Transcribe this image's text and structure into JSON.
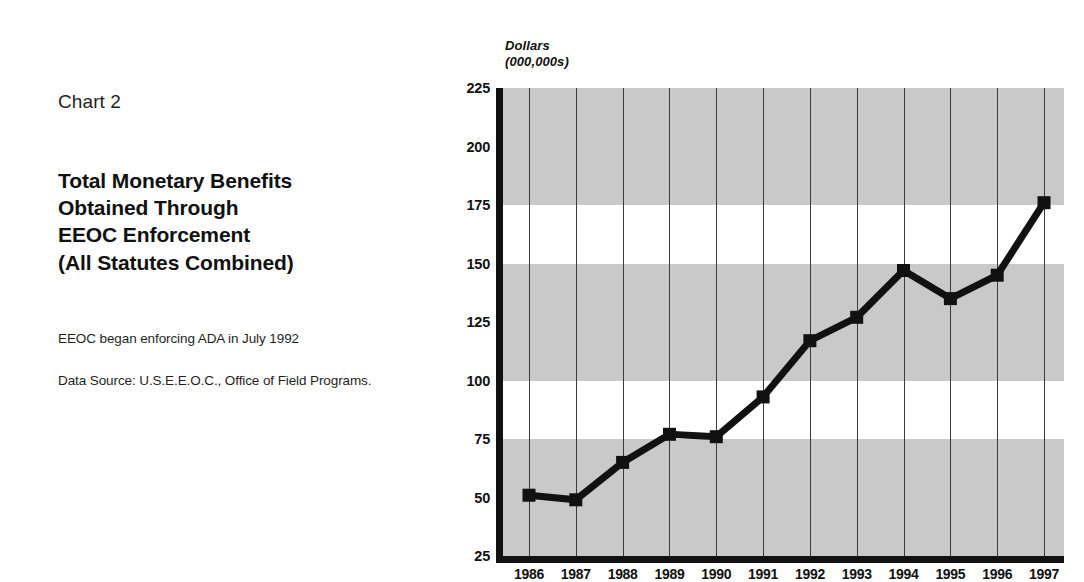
{
  "chart_label": "Chart 2",
  "title_lines": [
    "Total Monetary Benefits",
    "Obtained Through",
    "EEOC Enforcement",
    "(All Statutes Combined)"
  ],
  "notes": [
    "EEOC began enforcing ADA in July 1992",
    "Data Source: U.S.E.E.O.C., Office of Field Programs."
  ],
  "axis_unit_lines": [
    "Dollars",
    "(000,000s)"
  ],
  "colors": {
    "band": "#c9c9c9",
    "line": "#111111",
    "axis": "#111111",
    "gridline": "#3a3a3a",
    "background": "#ffffff"
  },
  "chart_data": {
    "type": "line",
    "title": "Total Monetary Benefits Obtained Through EEOC Enforcement (All Statutes Combined)",
    "xlabel": "",
    "ylabel": "Dollars (000,000s)",
    "categories": [
      "1986",
      "1987",
      "1988",
      "1989",
      "1990",
      "1991",
      "1992",
      "1993",
      "1994",
      "1995",
      "1996",
      "1997"
    ],
    "values": [
      51,
      49,
      65,
      77,
      76,
      93,
      117,
      127,
      147,
      135,
      145,
      176
    ],
    "ylim": [
      25,
      225
    ],
    "yticks": [
      25,
      50,
      75,
      100,
      125,
      150,
      175,
      200,
      225
    ],
    "grid": "vertical-lines-and-horizontal-shaded-bands",
    "shaded_bands": [
      [
        25,
        75
      ],
      [
        100,
        150
      ],
      [
        175,
        225
      ]
    ],
    "legend": "none",
    "marker": "square",
    "annotations": [
      "EEOC began enforcing ADA in July 1992",
      "Data Source: U.S.E.E.O.C., Office of Field Programs."
    ]
  }
}
